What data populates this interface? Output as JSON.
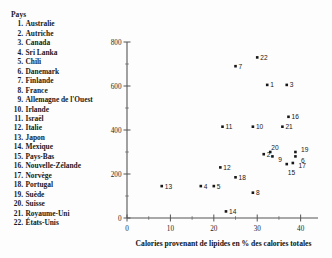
{
  "legend": {
    "title": "Pays",
    "items": [
      {
        "n": "1.",
        "label": "Australie"
      },
      {
        "n": "2.",
        "label": "Autriche"
      },
      {
        "n": "3.",
        "label": "Canada"
      },
      {
        "n": "4.",
        "label": "Sri Lanka"
      },
      {
        "n": "5.",
        "label": "Chili"
      },
      {
        "n": "6.",
        "label": "Danemark"
      },
      {
        "n": "7.",
        "label": "Finlande"
      },
      {
        "n": "8.",
        "label": "France"
      },
      {
        "n": "9.",
        "label": "Allemagne de l'Ouest"
      },
      {
        "n": "10.",
        "label": "Irlande"
      },
      {
        "n": "11.",
        "label": "Israël"
      },
      {
        "n": "12.",
        "label": "Italie"
      },
      {
        "n": "13.",
        "label": "Japon"
      },
      {
        "n": "14.",
        "label": "Mexique"
      },
      {
        "n": "15.",
        "label": "Pays-Bas"
      },
      {
        "n": "16.",
        "label": "Nouvelle-Zélande"
      },
      {
        "n": "17.",
        "label": "Norvège"
      },
      {
        "n": "18.",
        "label": "Portugal"
      },
      {
        "n": "19.",
        "label": "Suède"
      },
      {
        "n": "20.",
        "label": "Suisse"
      },
      {
        "n": "21.",
        "label": "Royaume-Uni"
      },
      {
        "n": "22.",
        "label": "États-Unis"
      }
    ]
  },
  "chart_data": {
    "type": "scatter",
    "title": "",
    "xlabel": "Calories provenant de lipides en % des calories totales",
    "ylabel": "",
    "xlim": [
      0,
      44
    ],
    "ylim": [
      0,
      800
    ],
    "xticks": [
      0,
      10,
      20,
      30,
      40
    ],
    "yticks": [
      0,
      200,
      400,
      600,
      800
    ],
    "xticklabels": [
      "0",
      "10",
      "20",
      "30",
      "40"
    ],
    "yticklabels": [
      "0",
      "200",
      "400",
      "600",
      "800"
    ],
    "grid": false,
    "legend_position": "outside-left",
    "point_color": "#171717",
    "points": [
      {
        "label": "1",
        "country": "Australie",
        "x": 32.3,
        "y": 605
      },
      {
        "label": "2",
        "country": "Autriche",
        "x": 31.5,
        "y": 290
      },
      {
        "label": "3",
        "country": "Canada",
        "x": 36.8,
        "y": 605
      },
      {
        "label": "4",
        "country": "Sri Lanka",
        "x": 17.0,
        "y": 145
      },
      {
        "label": "5",
        "country": "Chili",
        "x": 20.0,
        "y": 145
      },
      {
        "label": "6",
        "country": "Danemark",
        "x": 38.8,
        "y": 280
      },
      {
        "label": "7",
        "country": "Finlande",
        "x": 25.0,
        "y": 690
      },
      {
        "label": "8",
        "country": "France",
        "x": 29.0,
        "y": 115
      },
      {
        "label": "9",
        "country": "Allemagne de l'Ouest",
        "x": 33.5,
        "y": 280
      },
      {
        "label": "10",
        "country": "Irlande",
        "x": 29.0,
        "y": 415
      },
      {
        "label": "11",
        "country": "Israël",
        "x": 22.0,
        "y": 415
      },
      {
        "label": "12",
        "country": "Italie",
        "x": 21.5,
        "y": 230
      },
      {
        "label": "13",
        "country": "Japon",
        "x": 8.0,
        "y": 145
      },
      {
        "label": "14",
        "country": "Mexique",
        "x": 22.8,
        "y": 30
      },
      {
        "label": "15",
        "country": "Pays-Bas",
        "x": 36.8,
        "y": 245
      },
      {
        "label": "16",
        "country": "Nouvelle-Zélande",
        "x": 37.2,
        "y": 460
      },
      {
        "label": "17",
        "country": "Norvège",
        "x": 38.2,
        "y": 250
      },
      {
        "label": "18",
        "country": "Portugal",
        "x": 25.0,
        "y": 185
      },
      {
        "label": "19",
        "country": "Suède",
        "x": 38.8,
        "y": 300
      },
      {
        "label": "20",
        "country": "Suisse",
        "x": 33.0,
        "y": 300
      },
      {
        "label": "21",
        "country": "Royaume-Uni",
        "x": 35.8,
        "y": 415
      },
      {
        "label": "22",
        "country": "États-Unis",
        "x": 30.0,
        "y": 730
      }
    ]
  }
}
